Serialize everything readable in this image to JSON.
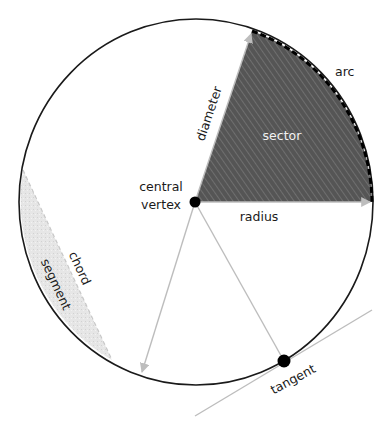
{
  "diagram": {
    "colors": {
      "circle_stroke": "#1a1a1a",
      "sector_fill": "#555555",
      "sector_hatch": "#7a7a7a",
      "segment_fill": "#e4e4e4",
      "guide_line": "#bdbdbd",
      "point": "#000000"
    },
    "labels": {
      "arc": "arc",
      "sector": "sector",
      "diameter": "diameter",
      "central": "central",
      "vertex": "vertex",
      "radius": "radius",
      "chord": "chord",
      "segment": "segment",
      "tangent": "tangent"
    }
  }
}
